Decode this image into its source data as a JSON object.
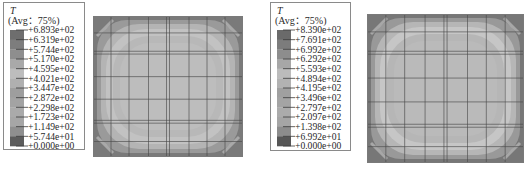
{
  "chart_data": [
    {
      "type": "heatmap",
      "title": "",
      "variable": "T",
      "averaging": "(Avg：75%)",
      "legend_position": "left",
      "colormap": "grayscale contour bands (rendered gray)",
      "legend_values": [
        "+6.893e+02",
        "+6.319e+02",
        "+5.744e+02",
        "+5.170e+02",
        "+4.595e+02",
        "+4.021e+02",
        "+3.447e+02",
        "+2.872e+02",
        "+2.298e+02",
        "+1.723e+02",
        "+1.149e+02",
        "+5.744e+01",
        "+0.000e+00"
      ],
      "band_colors": [
        "#6e6e6e",
        "#7d7d7d",
        "#8e8e8e",
        "#a9a9a9",
        "#bdbdbd",
        "#b0b0b0",
        "#9e9e9e",
        "#a3a3a3",
        "#aaaaaa",
        "#a6a6a6",
        "#8f8f8f",
        "#5c5c5c"
      ],
      "range": [
        0,
        689.3
      ],
      "field_description": "Square domain; highest-value bands near the corners (dark), rings of intermediate values inward, uniform light interior",
      "contour_fill": [
        "#5f5f5f",
        "#7a7a7a",
        "#9a9a9a",
        "#b4b4b4",
        "#c2c2c2",
        "#b8b8b8",
        "#bdbdbd"
      ],
      "mesh_lines_x": 8,
      "mesh_lines_y": 8
    },
    {
      "type": "heatmap",
      "title": "",
      "variable": "T",
      "averaging": "(Avg：75%)",
      "legend_position": "left",
      "colormap": "grayscale contour bands (rendered gray)",
      "legend_values": [
        "+8.390e+02",
        "+7.691e+02",
        "+6.992e+02",
        "+6.292e+02",
        "+5.593e+02",
        "+4.894e+02",
        "+4.195e+02",
        "+3.496e+02",
        "+2.797e+02",
        "+2.097e+02",
        "+1.398e+02",
        "+6.992e+01",
        "+0.000e+00"
      ],
      "band_colors": [
        "#6a6a6a",
        "#7c7c7c",
        "#8d8d8d",
        "#a7a7a7",
        "#bcbcbc",
        "#b2b2b2",
        "#a0a0a0",
        "#a4a4a4",
        "#ababab",
        "#a5a5a5",
        "#8c8c8c",
        "#565656"
      ],
      "range": [
        0,
        839.0
      ],
      "field_description": "Square domain; highest-value bands near the corners (dark), rings of intermediate values inward, uniform light interior",
      "contour_fill": [
        "#5a5a5a",
        "#777777",
        "#999999",
        "#b6b6b6",
        "#c6c6c6",
        "#b6b6b6",
        "#bababa"
      ],
      "mesh_lines_x": 8,
      "mesh_lines_y": 8
    }
  ]
}
